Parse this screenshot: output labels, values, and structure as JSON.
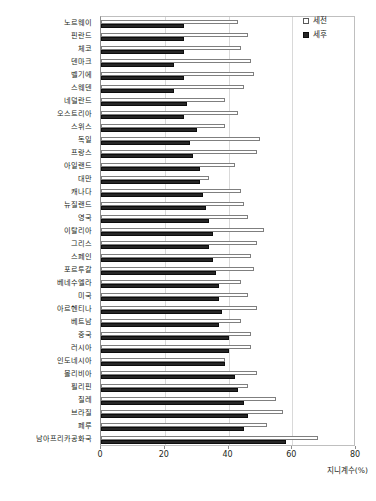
{
  "chart_data": {
    "type": "bar",
    "orientation": "horizontal",
    "title": "",
    "xlabel": "지니계수(%)",
    "ylabel": "",
    "xlim": [
      0,
      80
    ],
    "xticks": [
      0,
      20,
      40,
      60,
      80
    ],
    "grid": true,
    "legend_position": "top-right",
    "categories": [
      "노르웨이",
      "핀란드",
      "체코",
      "덴마크",
      "벨기에",
      "스웨덴",
      "네덜란드",
      "오스트리아",
      "스위스",
      "독일",
      "프랑스",
      "아일랜드",
      "대만",
      "캐나다",
      "뉴질랜드",
      "영국",
      "이탈리아",
      "그리스",
      "스페인",
      "포르투갈",
      "베네수엘라",
      "미국",
      "아르헨티나",
      "베트남",
      "중국",
      "러시아",
      "인도네시아",
      "볼리비아",
      "필리핀",
      "칠레",
      "브라질",
      "페루",
      "남아프리카공화국"
    ],
    "series": [
      {
        "name": "세전",
        "values": [
          43,
          46,
          44,
          47,
          48,
          45,
          39,
          43,
          39,
          50,
          49,
          42,
          34,
          44,
          45,
          46,
          51,
          49,
          47,
          48,
          44,
          46,
          49,
          44,
          47,
          47,
          39,
          49,
          46,
          55,
          57,
          52,
          68
        ]
      },
      {
        "name": "세후",
        "values": [
          26,
          26,
          26,
          23,
          26,
          23,
          27,
          26,
          30,
          28,
          29,
          31,
          31,
          32,
          33,
          34,
          35,
          34,
          35,
          36,
          37,
          37,
          38,
          37,
          40,
          40,
          39,
          42,
          43,
          45,
          46,
          45,
          58
        ]
      }
    ]
  },
  "legend": {
    "items": [
      {
        "label": "세전",
        "swatch": "white-outlined-square"
      },
      {
        "label": "세후",
        "swatch": "black-filled-square"
      }
    ]
  },
  "axis": {
    "x_title": "지니계수(%)",
    "x_tick_labels": [
      "0",
      "20",
      "40",
      "60",
      "80"
    ]
  }
}
